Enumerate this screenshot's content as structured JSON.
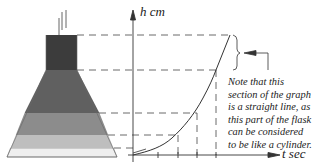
{
  "diagram": {
    "y_axis_label": "h cm",
    "x_axis_label": "t sec",
    "note_lines": [
      "Note that this",
      "section of the graph",
      "is a straight line, as",
      "this part of the flask",
      "can be considered",
      "to be like a cylinder."
    ],
    "flask_layers": [
      {
        "name": "neck",
        "color": "#3c3c3c"
      },
      {
        "name": "upper-cone",
        "color": "#606060"
      },
      {
        "name": "middle-band",
        "color": "#8c8c8c"
      },
      {
        "name": "lower-band",
        "color": "#bebebe"
      },
      {
        "name": "base-band",
        "color": "#efefef"
      }
    ],
    "level_marks_y": [
      35,
      70,
      113,
      135,
      148
    ],
    "line_color": "#333333"
  }
}
